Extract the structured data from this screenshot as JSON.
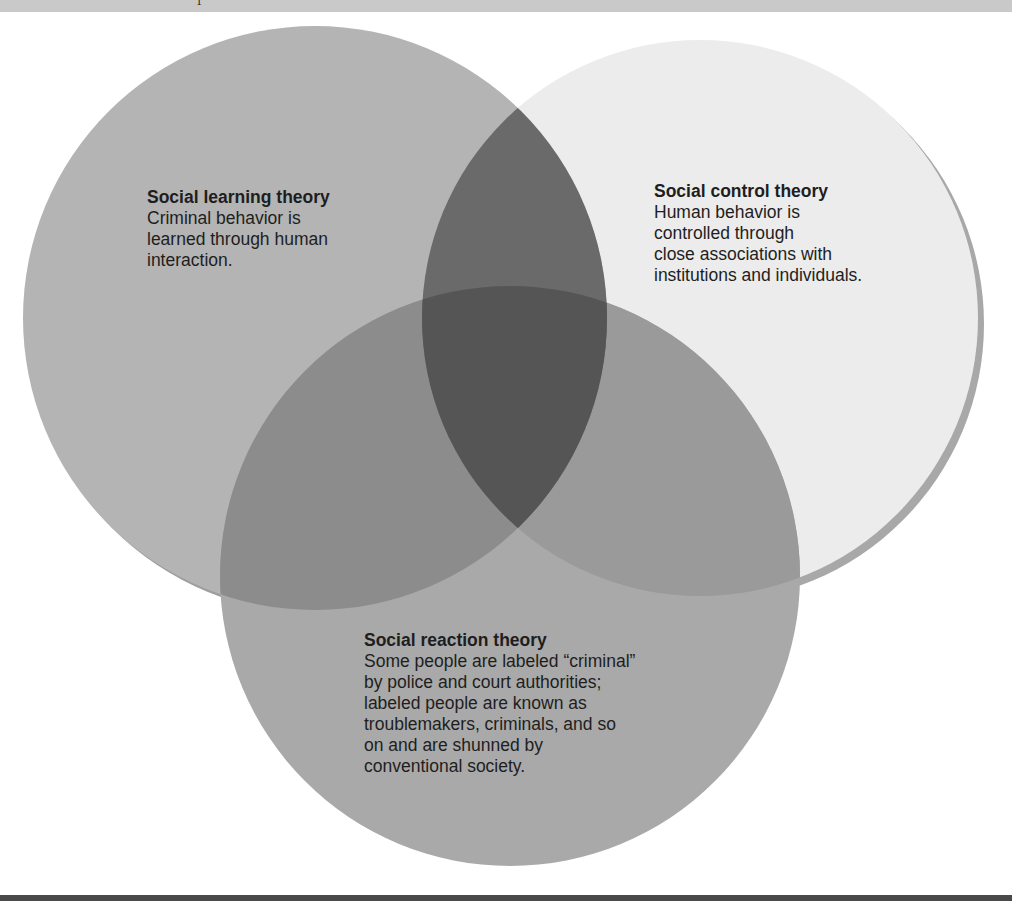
{
  "diagram": {
    "type": "venn",
    "header_glyph": "1",
    "circles": [
      {
        "id": "learning",
        "title": "Social learning theory",
        "lines": [
          "Criminal behavior is",
          "learned through human",
          "interaction."
        ],
        "fill": "#b4b4b4"
      },
      {
        "id": "control",
        "title": "Social control theory",
        "lines": [
          "Human behavior is",
          "controlled through",
          "close associations with",
          "institutions and individuals."
        ],
        "fill": "#ececec",
        "shadow": "#a8a8a8"
      },
      {
        "id": "reaction",
        "title": "Social reaction theory",
        "lines": [
          "Some people are labeled “criminal”",
          "by police and court authorities;",
          "labeled people are known as",
          "troublemakers, criminals, and so",
          "on and are shunned by",
          "conventional society."
        ],
        "fill": "#a9a9a9"
      }
    ],
    "overlap_colors": {
      "learning_control": "#6a6a6a",
      "learning_reaction": "#8c8c8c",
      "control_reaction": "#9a9a9a",
      "all_three": "#555555"
    },
    "band_color": "#c9c9c9",
    "rule_color": "#4a4a4a"
  }
}
